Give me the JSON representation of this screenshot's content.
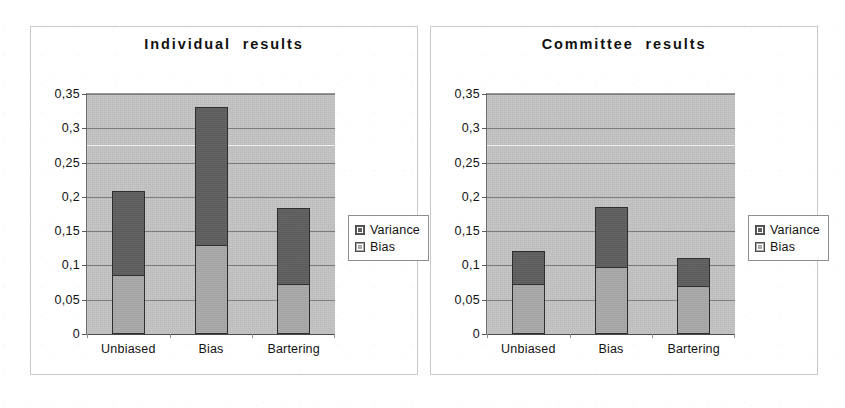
{
  "figure": {
    "panels": [
      {
        "id": "individual",
        "title": "Individual  results",
        "legend": {
          "variance_label": "Variance",
          "bias_label": "Bias"
        }
      },
      {
        "id": "committee",
        "title": "Committee  results",
        "legend": {
          "variance_label": "Variance",
          "bias_label": "Bias"
        }
      }
    ],
    "colors": {
      "variance": "#5e5e5e",
      "bias": "#a8a8a8",
      "plot_background": "#c2c2c2",
      "gridline": "#7c7c7c",
      "frame": "#c9c9c9"
    }
  },
  "chart_data": [
    {
      "type": "bar",
      "subtype": "stacked",
      "title": "Individual  results",
      "xlabel": "",
      "ylabel": "",
      "categories": [
        "Unbiased",
        "Bias",
        "Bartering"
      ],
      "series": [
        {
          "name": "Bias",
          "values": [
            0.084,
            0.128,
            0.072
          ]
        },
        {
          "name": "Variance",
          "values": [
            0.123,
            0.202,
            0.111
          ]
        }
      ],
      "totals": [
        0.207,
        0.33,
        0.183
      ],
      "ylim": [
        0,
        0.35
      ],
      "yticks": [
        0,
        0.05,
        0.1,
        0.15,
        0.2,
        0.25,
        0.3,
        0.35
      ],
      "ytick_labels": [
        "0",
        "0,05",
        "0,1",
        "0,15",
        "0,2",
        "0,25",
        "0,3",
        "0,35"
      ],
      "grid": true,
      "legend": [
        "Variance",
        "Bias"
      ],
      "legend_position": "right"
    },
    {
      "type": "bar",
      "subtype": "stacked",
      "title": "Committee  results",
      "xlabel": "",
      "ylabel": "",
      "categories": [
        "Unbiased",
        "Bias",
        "Bartering"
      ],
      "series": [
        {
          "name": "Bias",
          "values": [
            0.072,
            0.097,
            0.069
          ]
        },
        {
          "name": "Variance",
          "values": [
            0.047,
            0.087,
            0.04
          ]
        }
      ],
      "totals": [
        0.119,
        0.184,
        0.109
      ],
      "ylim": [
        0,
        0.35
      ],
      "yticks": [
        0,
        0.05,
        0.1,
        0.15,
        0.2,
        0.25,
        0.3,
        0.35
      ],
      "ytick_labels": [
        "0",
        "0,05",
        "0,1",
        "0,15",
        "0,2",
        "0,25",
        "0,3",
        "0,35"
      ],
      "grid": true,
      "legend": [
        "Variance",
        "Bias"
      ],
      "legend_position": "right"
    }
  ]
}
